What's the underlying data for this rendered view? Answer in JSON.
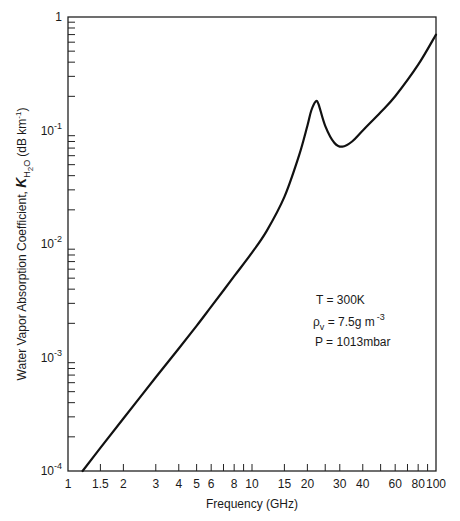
{
  "chart_data": {
    "type": "line",
    "title": "",
    "xlabel": "Frequency (GHz)",
    "ylabel": "Water Vapor Absorption Coefficient, K_H2O (dB km^-1)",
    "ylabel_parts": {
      "main": "Water Vapor Absorption Coefficient, ",
      "symbol": "K",
      "subscript": "H",
      "subscript2": "2",
      "subscript3": "O",
      "units_prefix": "(dB km",
      "units_sup": "-1",
      "units_suffix": ")"
    },
    "xscale": "log",
    "yscale": "log",
    "xlim": [
      1,
      100
    ],
    "ylim": [
      0.0001,
      1
    ],
    "grid": false,
    "x_tick_labels": [
      "1",
      "1.5",
      "2",
      "3",
      "4",
      "5",
      "6",
      "8",
      "10",
      "15",
      "20",
      "30",
      "40",
      "60",
      "80",
      "100"
    ],
    "x_tick_values": [
      1,
      1.5,
      2,
      3,
      4,
      5,
      6,
      8,
      10,
      15,
      20,
      30,
      40,
      60,
      80,
      100
    ],
    "x_minor_ticks": [
      7,
      9,
      25,
      50,
      70,
      90
    ],
    "y_tick_labels": [
      {
        "base": "10",
        "exp": "-4",
        "value": 0.0001
      },
      {
        "base": "10",
        "exp": "-3",
        "value": 0.001
      },
      {
        "base": "10",
        "exp": "-2",
        "value": 0.01
      },
      {
        "base": "10",
        "exp": "-1",
        "value": 0.1
      },
      {
        "base": "1",
        "exp": "",
        "value": 1
      }
    ],
    "series": [
      {
        "name": "Water vapor absorption",
        "x": [
          1.2,
          1.5,
          2,
          3,
          4,
          5,
          6,
          8,
          10,
          12,
          15,
          18,
          20,
          21,
          22.2,
          23,
          25,
          28,
          31,
          35,
          40,
          50,
          60,
          80,
          100
        ],
        "y": [
          0.0001,
          0.00016,
          0.00029,
          0.00067,
          0.0012,
          0.0019,
          0.0028,
          0.0052,
          0.0084,
          0.013,
          0.026,
          0.06,
          0.11,
          0.15,
          0.18,
          0.17,
          0.11,
          0.078,
          0.072,
          0.08,
          0.1,
          0.145,
          0.2,
          0.38,
          0.7
        ]
      }
    ],
    "annotations": [
      {
        "text": "T = 300K"
      },
      {
        "text": "ρv = 7.5g m^-3",
        "symbol": "ρ",
        "sub": "v",
        "main": " = 7.5g m",
        "sup": "-3"
      },
      {
        "text": "P = 1013mbar"
      }
    ],
    "line_color": "#111111"
  }
}
